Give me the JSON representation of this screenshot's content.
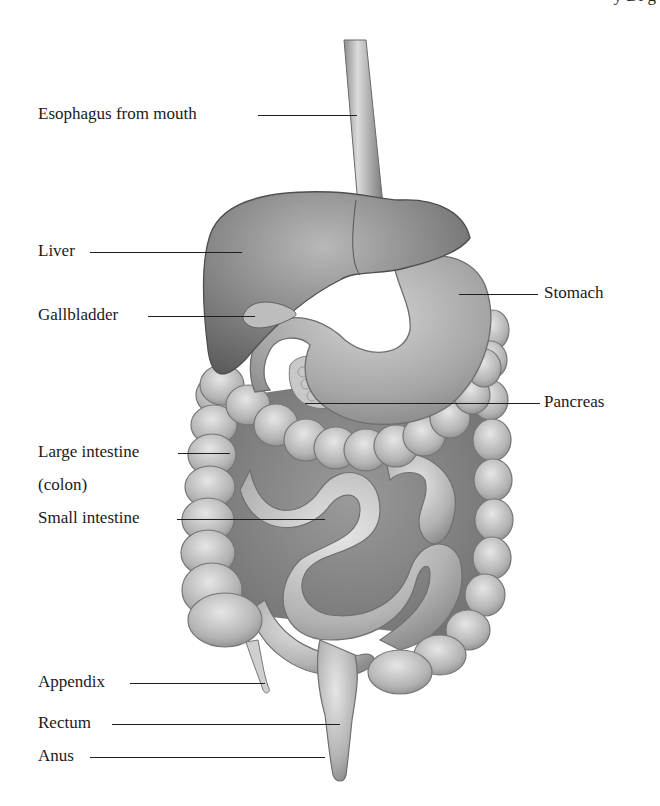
{
  "figure": {
    "header_fragment": "y Di g"
  },
  "labels": {
    "esophagus": "Esophagus from mouth",
    "liver": "Liver",
    "gallbladder": "Gallbladder",
    "stomach": "Stomach",
    "pancreas": "Pancreas",
    "large_intestine_line1": "Large intestine",
    "large_intestine_line2": "(colon)",
    "small_intestine": "Small intestine",
    "appendix": "Appendix",
    "rectum": "Rectum",
    "anus": "Anus"
  },
  "colors": {
    "background": "#ffffff",
    "label_text": "#1a1a1a",
    "leader_line": "#1f1f1f",
    "organ_dark": "#6e6e6e",
    "organ_mid": "#a3a3a3",
    "organ_light": "#d6d6d6"
  }
}
